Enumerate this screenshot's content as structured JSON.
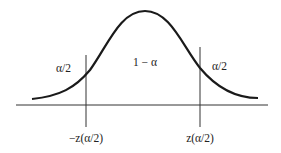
{
  "diagram": {
    "labels": {
      "left_tail": "α/2",
      "center": "1 − α",
      "right_tail": "α/2",
      "left_critical": "−z(α/2)",
      "right_critical": "z(α/2)"
    },
    "colors": {
      "curve": "#1a1a1a",
      "axis": "#333333",
      "text": "#222222"
    }
  }
}
